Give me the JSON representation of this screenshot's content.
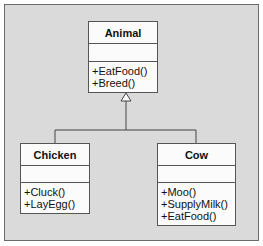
{
  "diagram": {
    "type": "uml-class",
    "classes": [
      {
        "name": "Animal",
        "attributes": [],
        "methods": [
          "+EatFood()",
          "+Breed()"
        ]
      },
      {
        "name": "Chicken",
        "attributes": [],
        "methods": [
          "+Cluck()",
          "+LayEgg()"
        ]
      },
      {
        "name": "Cow",
        "attributes": [],
        "methods": [
          "+Moo()",
          "+SupplyMilk()",
          "+EatFood()"
        ]
      }
    ],
    "relationships": [
      {
        "type": "generalization",
        "from": "Chicken",
        "to": "Animal"
      },
      {
        "type": "generalization",
        "from": "Cow",
        "to": "Animal"
      }
    ]
  }
}
